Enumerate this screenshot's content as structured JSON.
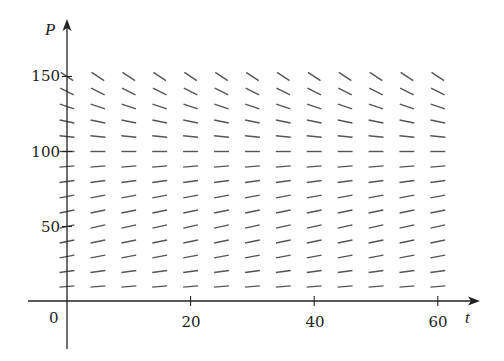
{
  "chart_data": {
    "type": "slope_field",
    "title": "",
    "xlabel": "t",
    "ylabel": "P",
    "x_ticks": [
      20,
      40,
      60
    ],
    "y_ticks": [
      50,
      100,
      150
    ],
    "origin_label": "0",
    "xlim": [
      -6,
      66
    ],
    "ylim": [
      -30,
      188
    ],
    "grid": false,
    "legend": null,
    "field": {
      "equation": "dP/dt = k P (1 - P/100)",
      "equilibria": [
        0,
        100
      ],
      "t_values": [
        0,
        5,
        10,
        15,
        20,
        25,
        30,
        35,
        40,
        45,
        50,
        55,
        60
      ],
      "P_values": [
        10,
        20,
        30,
        40,
        50,
        60,
        70,
        80,
        90,
        100,
        110,
        120,
        130,
        140,
        150
      ],
      "slope_description": "positive and small below P=100 (max near P=50), zero at P=100, increasingly negative above P=100"
    }
  },
  "axes": {
    "x_label": "t",
    "y_label": "P",
    "origin": "0",
    "x_tick_labels": [
      "20",
      "40",
      "60"
    ],
    "y_tick_labels": [
      "50",
      "100",
      "150"
    ]
  },
  "colors": {
    "axis": "#222222",
    "segment": "#555555"
  }
}
